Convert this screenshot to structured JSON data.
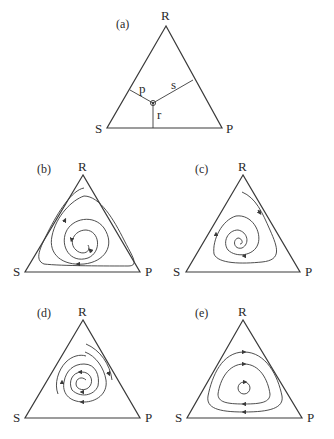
{
  "figure": {
    "panels": [
      {
        "id": "a",
        "label": "(a)",
        "vertices": {
          "top": "R",
          "left": "S",
          "right": "P"
        },
        "interior_labels": {
          "p": "p",
          "s": "s",
          "r": "r"
        },
        "description": "Simplex with interior point and perpendicular distances p, s, r to the sides"
      },
      {
        "id": "b",
        "label": "(b)",
        "vertices": {
          "top": "R",
          "left": "S",
          "right": "P"
        },
        "description": "Trajectory spiralling outward toward the boundary (heteroclinic cycle)"
      },
      {
        "id": "c",
        "label": "(c)",
        "vertices": {
          "top": "R",
          "left": "S",
          "right": "P"
        },
        "description": "Trajectories spiralling inward to the interior equilibrium"
      },
      {
        "id": "d",
        "label": "(d)",
        "vertices": {
          "top": "R",
          "left": "S",
          "right": "P"
        },
        "description": "Trajectories converging to a stable limit cycle"
      },
      {
        "id": "e",
        "label": "(e)",
        "vertices": {
          "top": "R",
          "left": "S",
          "right": "P"
        },
        "description": "Closed periodic orbits around the interior equilibrium"
      }
    ]
  },
  "colors": {
    "stroke": "#3a3a3a",
    "text": "#2a2a2a",
    "background": "#ffffff"
  }
}
